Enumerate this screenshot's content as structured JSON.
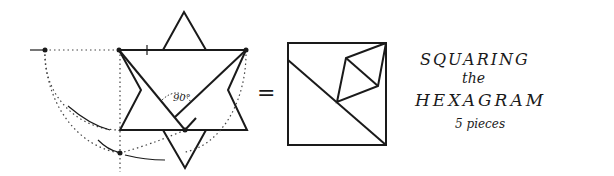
{
  "diagram": {
    "title_line1": "SQUARING",
    "title_line2": "the",
    "title_line3": "HEXAGRAM",
    "subtitle": "5 pieces",
    "angle_label": "90°",
    "equals_sign": "=",
    "figures": [
      "hexagram-dissection",
      "square-assembly"
    ],
    "ink_color": "#1a1a1a",
    "background": "#ffffff"
  }
}
